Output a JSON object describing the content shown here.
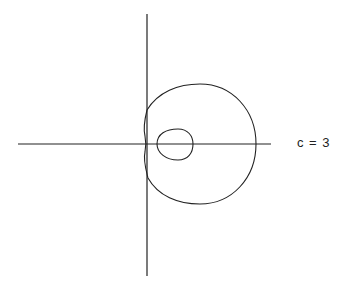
{
  "figure": {
    "label": "c = 3",
    "line_color": "#222222",
    "background": "#ffffff"
  },
  "axes": {
    "horizontal": {
      "x1": 18,
      "x2": 271,
      "y": 144
    },
    "vertical": {
      "x": 147,
      "y1": 14,
      "y2": 276
    }
  },
  "curves": {
    "outer_loop": {
      "description": "large near-circular loop",
      "left": 145,
      "right": 256,
      "top": 84,
      "bottom": 204
    },
    "inner_loop": {
      "description": "small inner loop",
      "left": 156,
      "right": 193,
      "top": 129,
      "bottom": 160
    }
  }
}
